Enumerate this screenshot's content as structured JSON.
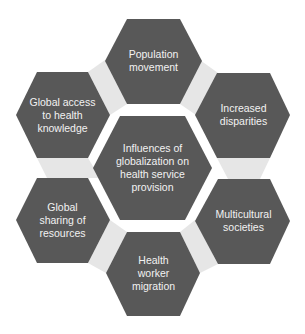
{
  "colors": {
    "hexagon_fill": "#585858",
    "connector_fill": "#e6e6e6",
    "label_text": "#f2f2f2",
    "background": "#ffffff"
  },
  "diagram": {
    "center": {
      "label": "Influences of\nglobalization on\nhealth service\nprovision"
    },
    "outer": [
      {
        "id": "top",
        "label": "Population\nmovement"
      },
      {
        "id": "upper-right",
        "label": "Increased\ndisparities"
      },
      {
        "id": "lower-right",
        "label": "Multicultural\nsocieties"
      },
      {
        "id": "bottom",
        "label": "Health\nworker\nmigration"
      },
      {
        "id": "lower-left",
        "label": "Global\nsharing of\nresources"
      },
      {
        "id": "upper-left",
        "label": "Global access\nto health\nknowledge"
      }
    ]
  }
}
